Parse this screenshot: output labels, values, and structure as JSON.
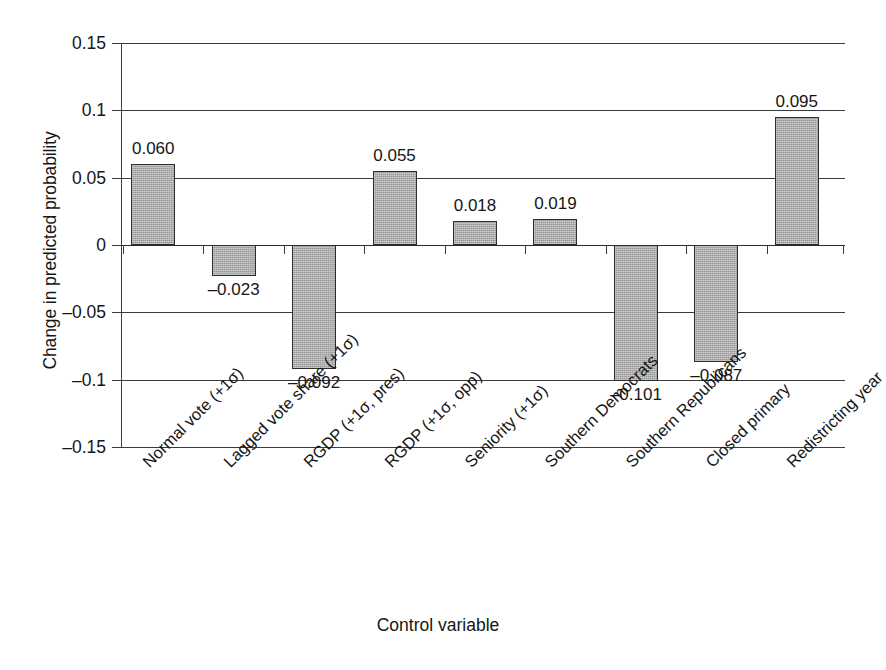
{
  "chart_data": {
    "type": "bar",
    "title": "",
    "xlabel": "Control variable",
    "ylabel": "Change in predicted probability",
    "categories": [
      "Normal vote (+1σ)",
      "Lagged vote share (+1σ)",
      "RGDP (+1σ, pres)",
      "RGDP (+1σ, opp)",
      "Seniority (+1σ)",
      "Southern Democrats",
      "Southern Republicans",
      "Closed primary",
      "Redistricting year"
    ],
    "values": [
      0.06,
      -0.023,
      -0.092,
      0.055,
      0.018,
      0.019,
      -0.101,
      -0.087,
      0.095
    ],
    "value_labels": [
      "0.060",
      "–0.023",
      "–0.092",
      "0.055",
      "0.018",
      "0.019",
      "–0.101",
      "–0.087",
      "0.095"
    ],
    "ylim": [
      -0.15,
      0.15
    ],
    "yticks": [
      0.15,
      0.1,
      0.05,
      0,
      -0.05,
      -0.1,
      -0.15
    ],
    "ytick_labels": [
      "0.15",
      "0.1",
      "0.05",
      "0",
      "–0.05",
      "–0.1",
      "–0.15"
    ],
    "grid": true,
    "legend": "none",
    "bar_color": "#a9a9a9",
    "bar_edge_color": "#2e2e2e",
    "axis_color": "#3b3b3b"
  }
}
